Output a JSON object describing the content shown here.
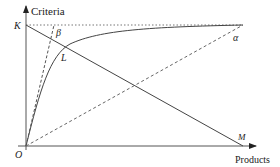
{
  "diagram": {
    "axes": {
      "y_label": "Criteria",
      "x_label": "Products",
      "origin_label": "O"
    },
    "points": {
      "K": "K",
      "L": "L",
      "M": "M"
    },
    "angles": {
      "alpha": "α",
      "beta": "β"
    },
    "elements": [
      {
        "type": "solid-line",
        "from": "K",
        "to": "M"
      },
      {
        "type": "solid-curve",
        "from": "O",
        "through": "L",
        "asymptote": "K-level"
      },
      {
        "type": "dashed-line",
        "from": "O",
        "angle": "beta"
      },
      {
        "type": "dashed-line",
        "from": "O",
        "angle": "alpha"
      },
      {
        "type": "dotted-line",
        "level": "K",
        "horizontal": true
      }
    ]
  }
}
